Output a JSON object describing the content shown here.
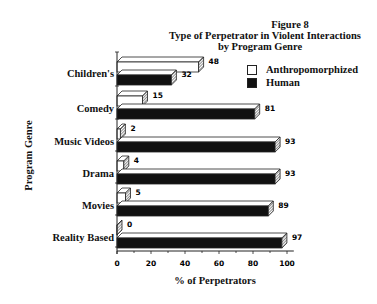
{
  "chart_data": {
    "type": "bar",
    "orientation": "horizontal",
    "title": "Figure 8",
    "subtitle": "Type of Perpetrator in Violent Interactions by Program Genre",
    "title_lines": [
      "Figure 8",
      "Type of Perpetrator in Violent Interactions",
      "by Program Genre"
    ],
    "xlabel": "% of Perpetrators",
    "ylabel": "Program Genre",
    "xlim": [
      0,
      100
    ],
    "xticks": [
      0,
      20,
      40,
      60,
      80,
      100
    ],
    "categories": [
      "Children's",
      "Comedy",
      "Music Videos",
      "Drama",
      "Movies",
      "Reality Based"
    ],
    "series": [
      {
        "name": "Anthropomorphized",
        "color": "#ffffff",
        "values": [
          48,
          15,
          2,
          4,
          5,
          0
        ]
      },
      {
        "name": "Human",
        "color": "#111111",
        "values": [
          32,
          81,
          93,
          93,
          89,
          97
        ]
      }
    ],
    "legend_position": "upper right",
    "grid": false,
    "style": "3d"
  }
}
